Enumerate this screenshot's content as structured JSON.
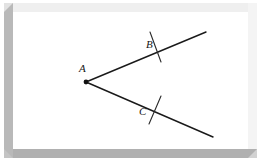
{
  "figure": {
    "type": "geometry-diagram",
    "background_color": "#ffffff",
    "stroke_color": "#1a1a1a",
    "frame": {
      "style": "beveled-raised",
      "top_color": "#efefef",
      "left_color": "#b9b9b9",
      "right_color": "#f4f4f4",
      "bottom_color": "#b0b0b0",
      "band_width": 9
    }
  },
  "chart_data": {
    "type": "diagram",
    "title": "",
    "vertex": {
      "label": "A",
      "x": 86,
      "y": 82
    },
    "rays": [
      {
        "name": "ray-AB",
        "from": {
          "x": 86,
          "y": 82
        },
        "to": {
          "x": 206,
          "y": 32
        },
        "point_label": "B",
        "tick_marks": 1
      },
      {
        "name": "ray-AC",
        "from": {
          "x": 86,
          "y": 82
        },
        "to": {
          "x": 213,
          "y": 137
        },
        "point_label": "C",
        "tick_marks": 1
      }
    ],
    "labels": [
      {
        "text": "A",
        "x": 79,
        "y": 72,
        "style": "italic-serif"
      },
      {
        "text": "B",
        "x": 146,
        "y": 48,
        "style": "italic-serif"
      },
      {
        "text": "C",
        "x": 139,
        "y": 115,
        "style": "italic-serif"
      }
    ],
    "ticks": [
      {
        "name": "tick-on-ray-AB",
        "x1": 150,
        "y1": 32,
        "x2": 161,
        "y2": 62
      },
      {
        "name": "tick-on-ray-AC",
        "x1": 161,
        "y1": 96,
        "x2": 149,
        "y2": 124
      }
    ]
  }
}
